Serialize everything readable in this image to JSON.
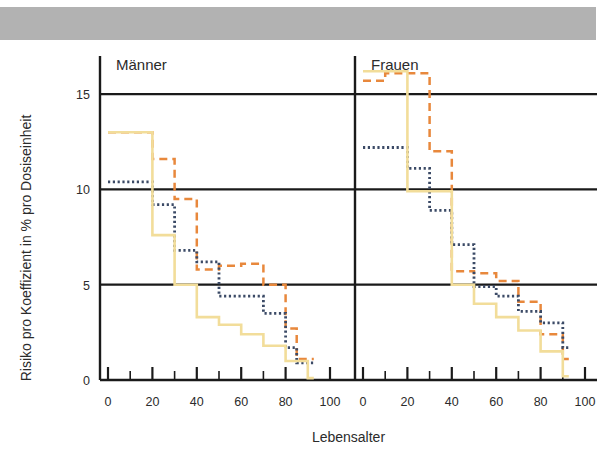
{
  "figure": {
    "decor_bar_color": "#b2b2b2"
  },
  "chart_data": {
    "type": "line",
    "title": "",
    "xlabel": "Lebensalter",
    "ylabel": "Risiko pro Koeffizient in % pro Dosiseinheit",
    "xlim": [
      0,
      100
    ],
    "ylim": [
      0,
      17
    ],
    "grid": true,
    "grid_values": [
      5,
      10,
      15
    ],
    "legend": "none",
    "xticks": [
      0,
      20,
      40,
      60,
      80,
      100
    ],
    "xtick_labels": [
      "0",
      "20",
      "40",
      "60",
      "80",
      "100"
    ],
    "x_minor_ticks": [
      10,
      30,
      50,
      70,
      90
    ],
    "yticks": [
      0,
      5,
      10,
      15
    ],
    "ytick_labels": [
      "0",
      "5",
      "10",
      "15"
    ],
    "panels": [
      {
        "name": "maenner",
        "label": "Männer",
        "series": [
          {
            "name": "series-orange-dashed",
            "style": "dashed",
            "color": "#e8883c",
            "step_x": [
              0,
              10,
              20,
              30,
              40,
              50,
              60,
              65,
              70,
              80,
              85,
              90
            ],
            "step_y": [
              13.0,
              13.0,
              11.6,
              9.5,
              5.8,
              6.0,
              6.1,
              6.1,
              5.0,
              2.7,
              1.1,
              1.1
            ]
          },
          {
            "name": "series-blue-dotted",
            "style": "dotted",
            "color": "#3b4a66",
            "step_x": [
              0,
              10,
              20,
              30,
              40,
              50,
              60,
              70,
              80,
              85,
              90
            ],
            "step_y": [
              10.4,
              10.4,
              9.2,
              6.8,
              6.2,
              4.4,
              4.4,
              3.5,
              1.7,
              0.9,
              0.9
            ]
          },
          {
            "name": "series-yellow-solid",
            "style": "solid",
            "color": "#f2dd9a",
            "step_x": [
              0,
              10,
              20,
              30,
              40,
              50,
              60,
              70,
              80,
              90
            ],
            "step_y": [
              13.0,
              13.0,
              7.6,
              5.0,
              3.3,
              2.9,
              2.4,
              1.8,
              1.0,
              0.1
            ]
          }
        ]
      },
      {
        "name": "frauen",
        "label": "Frauen",
        "series": [
          {
            "name": "series-orange-dashed",
            "style": "dashed",
            "color": "#e8883c",
            "step_x": [
              0,
              10,
              20,
              30,
              40,
              50,
              60,
              70,
              80,
              90
            ],
            "step_y": [
              15.7,
              16.1,
              16.1,
              12.0,
              5.7,
              5.6,
              5.2,
              4.1,
              2.4,
              1.1
            ]
          },
          {
            "name": "series-blue-dotted",
            "style": "dotted",
            "color": "#3b4a66",
            "step_x": [
              0,
              10,
              20,
              30,
              40,
              50,
              60,
              70,
              80,
              90
            ],
            "step_y": [
              12.2,
              12.2,
              11.1,
              8.9,
              7.1,
              4.9,
              4.4,
              3.6,
              3.0,
              1.7
            ]
          },
          {
            "name": "series-yellow-solid",
            "style": "solid",
            "color": "#f2dd9a",
            "step_x": [
              0,
              10,
              20,
              30,
              40,
              50,
              60,
              70,
              80,
              90
            ],
            "step_y": [
              16.2,
              16.2,
              9.9,
              9.9,
              5.0,
              4.0,
              3.3,
              2.6,
              1.5,
              0.2
            ]
          }
        ]
      }
    ]
  }
}
